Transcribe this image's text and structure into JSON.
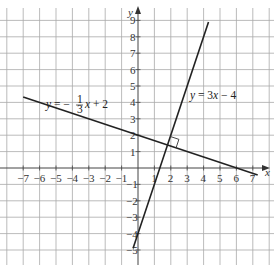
{
  "chart_data": {
    "type": "line",
    "title": "",
    "xlabel": "x",
    "ylabel": "y",
    "xlim": [
      -7.5,
      7.5
    ],
    "ylim": [
      -5.5,
      9.5
    ],
    "grid": true,
    "x_ticks": [
      -7,
      -6,
      -5,
      -4,
      -3,
      -2,
      -1,
      1,
      2,
      3,
      4,
      5,
      6,
      7
    ],
    "y_ticks": [
      -5,
      -4,
      -3,
      -2,
      -1,
      1,
      2,
      3,
      4,
      5,
      6,
      7,
      8,
      9
    ],
    "series": [
      {
        "name": "y = -1/3 x + 2",
        "slope": -0.3333,
        "intercept": 2,
        "x": [
          -7,
          -3,
          0,
          3,
          6,
          7.3
        ],
        "y": [
          4.33,
          3,
          2,
          1,
          0,
          -0.43
        ]
      },
      {
        "name": "y = 3x - 4",
        "slope": 3,
        "intercept": -4,
        "x": [
          -0.3,
          0,
          1,
          2,
          3,
          4.3
        ],
        "y": [
          -4.9,
          -4,
          -1,
          2,
          5,
          8.9
        ]
      }
    ],
    "annotations": [
      {
        "type": "right-angle-marker",
        "at": [
          1.8,
          1.4
        ],
        "note": "lines are perpendicular"
      }
    ]
  },
  "labels": {
    "x_axis": "x",
    "y_axis": "y",
    "line1_prefix": "y = −",
    "line1_frac_num": "1",
    "line1_frac_den": "3",
    "line1_suffix": "x + 2",
    "line2": "y = 3x − 4"
  },
  "x_tick_labels": [
    "−7",
    "−6",
    "−5",
    "−4",
    "−3",
    "−2",
    "−1",
    "1",
    "2",
    "3",
    "4",
    "5",
    "6",
    "7"
  ],
  "y_tick_labels": [
    "−5",
    "−4",
    "−3",
    "−2",
    "−1",
    "1",
    "2",
    "3",
    "4",
    "5",
    "6",
    "7",
    "8",
    "9"
  ]
}
